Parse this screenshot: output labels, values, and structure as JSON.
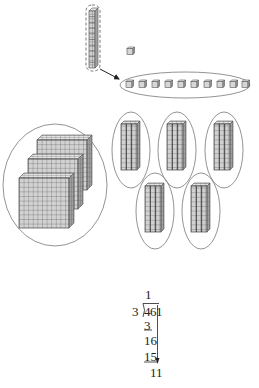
{
  "diagram": {
    "blocks": {
      "regrouped_ten": {
        "type": "rod",
        "units": 10
      },
      "single_unit": {
        "type": "unit",
        "count": 1
      },
      "unit_group": {
        "type": "unit",
        "count": 10
      },
      "hundreds_group": {
        "type": "flat",
        "count": 3
      },
      "tens_groups": {
        "count": 5,
        "rods_per_group": 3
      }
    },
    "colors": {
      "stroke": "#555555",
      "cube_face": "#d0d0d0",
      "cube_top": "#e6e6e6",
      "cube_side": "#9a9a9a",
      "ellipse": "#777777"
    }
  },
  "division": {
    "quotient": "1",
    "divisor": "3",
    "dividend": "461",
    "step1_subtract": "3",
    "step1_remainder": "16",
    "step2_subtract": "15",
    "step2_remainder": "11"
  }
}
